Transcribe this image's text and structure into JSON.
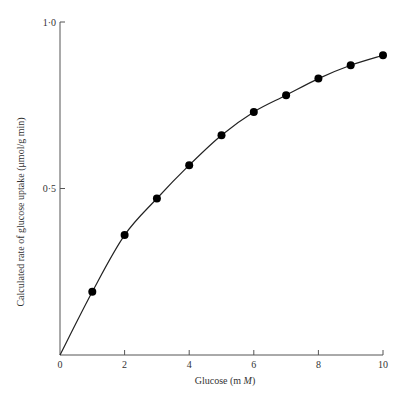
{
  "chart_data": {
    "type": "scatter",
    "title": "",
    "xlabel": "Glucose (m M)",
    "xlabel_parts": {
      "prefix": "Glucose (m ",
      "italic": "M",
      "suffix": ")"
    },
    "ylabel": "Calculated rate of glucose uptake (μmol/g min)",
    "xlim": [
      0,
      10
    ],
    "ylim": [
      0,
      1.0
    ],
    "x_ticks": [
      0,
      2,
      4,
      6,
      8,
      10
    ],
    "x_tick_labels": [
      "0",
      "2",
      "4",
      "6",
      "8",
      "10"
    ],
    "y_ticks": [
      0.5,
      1.0
    ],
    "y_tick_labels": [
      "0·5",
      "1·0"
    ],
    "grid": false,
    "legend": null,
    "series": [
      {
        "name": "Calculated uptake",
        "marker": "filled-circle",
        "line": "smooth-curve-through-origin",
        "x": [
          1,
          2,
          3,
          4,
          5,
          6,
          7,
          8,
          9,
          10
        ],
        "values": [
          0.19,
          0.36,
          0.47,
          0.57,
          0.66,
          0.73,
          0.78,
          0.83,
          0.87,
          0.9
        ]
      }
    ]
  }
}
